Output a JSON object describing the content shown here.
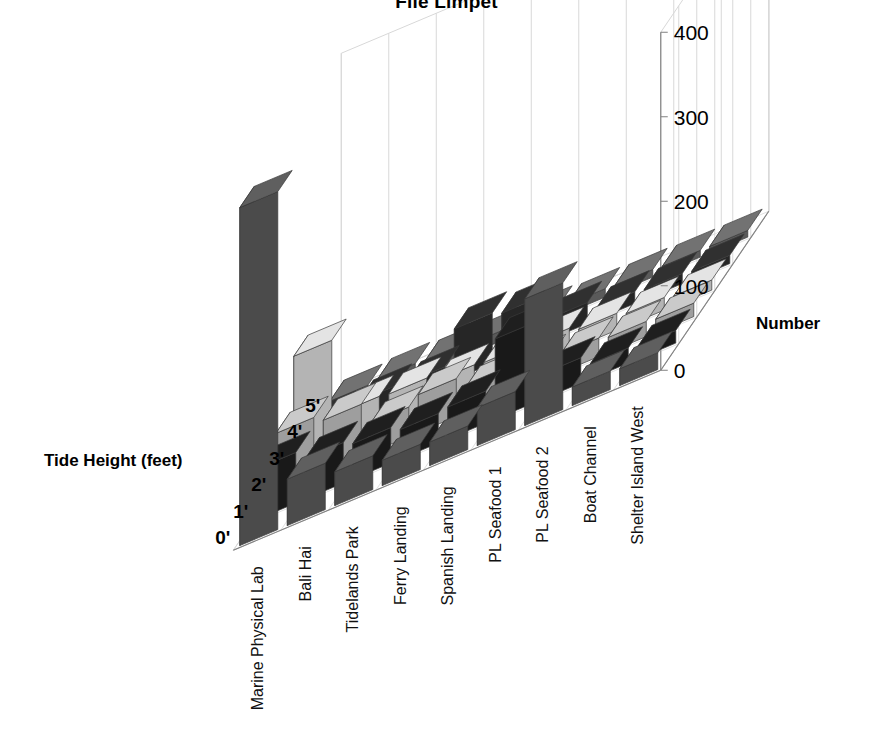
{
  "title": "File Limpet",
  "axes": {
    "value_axis_label": "Number",
    "value_ticks": [
      "0",
      "100",
      "200",
      "300",
      "400"
    ],
    "depth_axis_label": "Tide Height (feet)",
    "tide_ticks": [
      "0'",
      "1'",
      "2'",
      "3'",
      "4'",
      "5'"
    ]
  },
  "chart_data": {
    "type": "bar",
    "title": "File Limpet",
    "xlabel": "",
    "ylabel": "Number",
    "zlabel": "Tide Height (feet)",
    "ylim": [
      0,
      400
    ],
    "grid": true,
    "legend": "none",
    "projection": "3d",
    "categories": [
      "Marine Physical Lab",
      "Bali Hai",
      "Tidelands Park",
      "Ferry Landing",
      "Spanish Landing",
      "PL Seafood 1",
      "PL Seafood 2",
      "Boat Channel",
      "Shelter Island West"
    ],
    "series": [
      {
        "name": "5'",
        "color": "#555555",
        "values": [
          400,
          55,
          40,
          30,
          28,
          45,
          150,
          22,
          20
        ]
      },
      {
        "name": "4'",
        "color": "#1c1c1c",
        "values": [
          60,
          48,
          42,
          35,
          38,
          95,
          30,
          18,
          15
        ]
      },
      {
        "name": "3'",
        "color": "#b4b4b4",
        "values": [
          70,
          62,
          35,
          45,
          30,
          25,
          22,
          18,
          16
        ]
      },
      {
        "name": "2'",
        "color": "#cccccc",
        "values": [
          130,
          40,
          38,
          30,
          28,
          26,
          20,
          15,
          12
        ]
      },
      {
        "name": "1'",
        "color": "#2b2b2b",
        "values": [
          18,
          22,
          20,
          60,
          55,
          25,
          14,
          12,
          10
        ]
      },
      {
        "name": "0'",
        "color": "#666666",
        "values": [
          14,
          16,
          14,
          12,
          12,
          10,
          9,
          8,
          8
        ]
      }
    ]
  },
  "colors": {
    "axis_line": "#808080",
    "grid_line": "#d8d8d8",
    "background": "#ffffff",
    "text": "#000000"
  }
}
